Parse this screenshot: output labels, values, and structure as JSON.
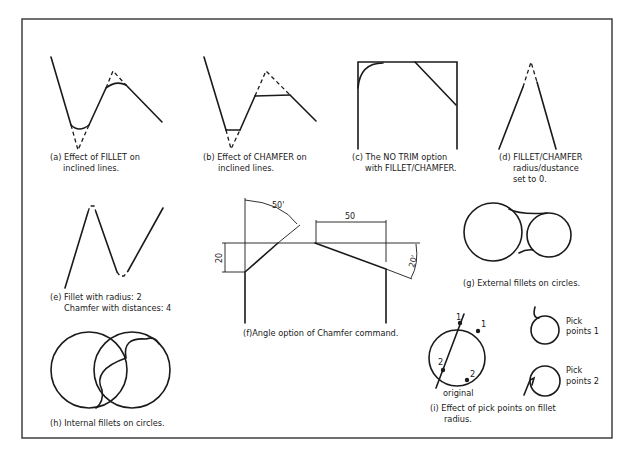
{
  "figure": {
    "panels": [
      {
        "id": "a",
        "caption_line1": "(a) Effect of FILLET on",
        "caption_line2": "inclined lines."
      },
      {
        "id": "b",
        "caption_line1": "(b) Effect of CHAMFER on",
        "caption_line2": "inclined lines."
      },
      {
        "id": "c",
        "caption_line1": "(c) The NO TRIM option",
        "caption_line2": "with FILLET/CHAMFER."
      },
      {
        "id": "d",
        "caption_line1": "(d) FILLET/CHAMFER",
        "caption_line2": "radius/dustance",
        "caption_line3": "set to 0."
      },
      {
        "id": "e",
        "caption_line1": "(e) Fillet with radius: 2",
        "caption_line2": "Chamfer with distances: 4"
      },
      {
        "id": "f",
        "caption_line1": "(f)Angle option of Chamfer command.",
        "dimensions": {
          "angle_top": "50'",
          "length_top": "50",
          "height_left": "20",
          "angle_right": "20'"
        }
      },
      {
        "id": "g",
        "caption_line1": "(g) External fillets on circles."
      },
      {
        "id": "h",
        "caption_line1": "(h) Internal fillets on circles."
      },
      {
        "id": "i",
        "caption_line1": "(i) Effect of pick points on fillet",
        "caption_line2": "radius.",
        "labels": {
          "line_pt1": "1",
          "line_pt2": "2",
          "circle_pt1": "1",
          "circle_pt2": "2",
          "original": "original",
          "pick1_line1": "Pick",
          "pick1_line2": "points  1",
          "pick2_line1": "Pick",
          "pick2_line2": "points  2"
        }
      }
    ]
  }
}
